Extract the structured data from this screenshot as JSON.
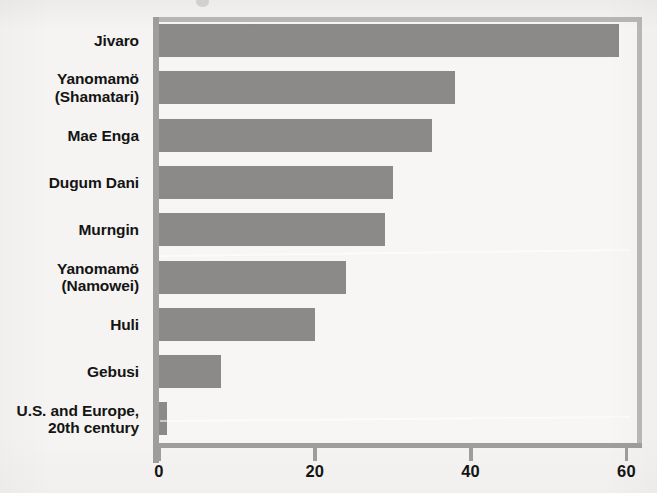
{
  "chart_data": {
    "type": "bar",
    "orientation": "horizontal",
    "title": "",
    "xlabel": "",
    "ylabel": "",
    "xlim": [
      0,
      62
    ],
    "xticks": [
      0,
      20,
      40,
      60
    ],
    "xtick_labels": [
      "0",
      "20",
      "40",
      "60"
    ],
    "grid": false,
    "legend": false,
    "bar_color": "#8b8a88",
    "categories": [
      "Jivaro",
      "Yanomamö\n(Shamatari)",
      "Mae Enga",
      "Dugum Dani",
      "Murngin",
      "Yanomamö\n(Namowei)",
      "Huli",
      "Gebusi",
      "U.S. and Europe,\n20th century"
    ],
    "values": [
      59,
      38,
      35,
      30,
      29,
      24,
      20,
      8,
      1
    ]
  },
  "chart": {
    "bars": [
      {
        "label_line1": "Jivaro",
        "label_line2": "",
        "value": 59
      },
      {
        "label_line1": "Yanomamö",
        "label_line2": "(Shamatari)",
        "value": 38
      },
      {
        "label_line1": "Mae Enga",
        "label_line2": "",
        "value": 35
      },
      {
        "label_line1": "Dugum Dani",
        "label_line2": "",
        "value": 30
      },
      {
        "label_line1": "Murngin",
        "label_line2": "",
        "value": 29
      },
      {
        "label_line1": "Yanomamö",
        "label_line2": "(Namowei)",
        "value": 24
      },
      {
        "label_line1": "Huli",
        "label_line2": "",
        "value": 20
      },
      {
        "label_line1": "Gebusi",
        "label_line2": "",
        "value": 8
      },
      {
        "label_line1": "U.S. and Europe,",
        "label_line2": "20th century",
        "value": 1
      }
    ],
    "axis": {
      "ticks": [
        {
          "value": 0,
          "label": "0"
        },
        {
          "value": 20,
          "label": "20"
        },
        {
          "value": 40,
          "label": "40"
        },
        {
          "value": 60,
          "label": "60"
        }
      ],
      "max": 62
    },
    "colors": {
      "bar": "#8b8a88",
      "frame": "#b9b8b6",
      "axis": "#9f9e9c",
      "text": "#141414",
      "background": "#f5f4f2",
      "plot_background": "#f7f6f4"
    }
  }
}
